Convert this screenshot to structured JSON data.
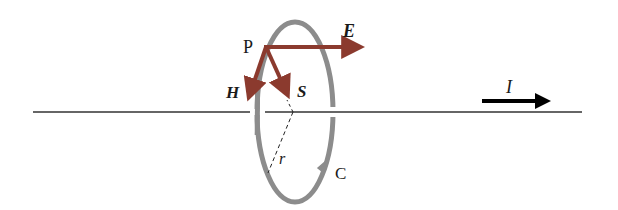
{
  "diagram": {
    "title": "",
    "labels": {
      "point": "P",
      "electric_field": "E",
      "magnetic_field": "H",
      "poynting_vector": "S",
      "radius": "r",
      "contour": "C",
      "current": "I"
    },
    "colors": {
      "vector_arrows": "#8b3a2e",
      "loop": "#8c8c8c",
      "wire": "#333333",
      "current_arrow": "#000000",
      "text": "#1a1a1a"
    }
  }
}
